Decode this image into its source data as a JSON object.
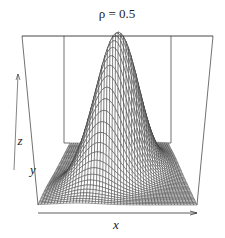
{
  "chart_data": {
    "type": "surface",
    "title": "ρ = 0.5",
    "function": "bivariate_normal_density",
    "parameters": {
      "rho": 0.5,
      "mu_x": 0,
      "mu_y": 0,
      "sigma_x": 1,
      "sigma_y": 1
    },
    "xlabel": "x",
    "ylabel": "y",
    "zlabel": "z",
    "xlim": [
      -3,
      3
    ],
    "ylim": [
      -3,
      3
    ],
    "grid_lines": 50,
    "ticks": false,
    "box": true,
    "line_color": "#333333"
  }
}
